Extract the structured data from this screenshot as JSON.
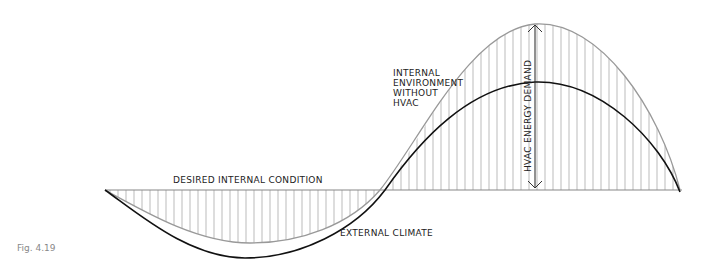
{
  "figure": {
    "caption": "Fig. 4.19",
    "labels": {
      "desired": "DESIRED INTERNAL CONDITION",
      "internal_line1": "INTERNAL",
      "internal_line2": "ENVIRONMENT",
      "internal_line3": "WITHOUT",
      "internal_line4": "HVAC",
      "external": "EXTERNAL CLIMATE",
      "demand": "HVAC ENERGY DEMAND"
    },
    "colors": {
      "baseline": "#888888",
      "internal_curve": "#999999",
      "external_curve": "#111111",
      "hatch": "#aaaaaa"
    }
  }
}
